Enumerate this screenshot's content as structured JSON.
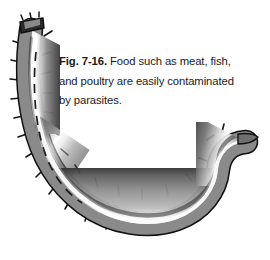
{
  "figure": {
    "label": "Fig. 7-16.",
    "caption_lines": [
      "Food such as meat, fish,",
      "and poultry are easily contaminated",
      "by parasites."
    ],
    "caption_full": "Fig. 7-16. Food such as meat, fish, and poultry are easily contaminated by parasites.",
    "background_color": "#ffffff",
    "text_color": "#1a1a1a",
    "illustration": {
      "outline_color": "#111111",
      "body_dark": "#4a4a4a",
      "body_mid": "#8c8c8c",
      "body_light": "#f2f2f2",
      "body_shadow": "#3a3a3a",
      "spine_color": "#1a1a1a",
      "gut_line_color": "#1c1c1c",
      "spine_count": 30,
      "has_dashed_gut_line": true,
      "shape": "hooked-j-curve"
    }
  }
}
